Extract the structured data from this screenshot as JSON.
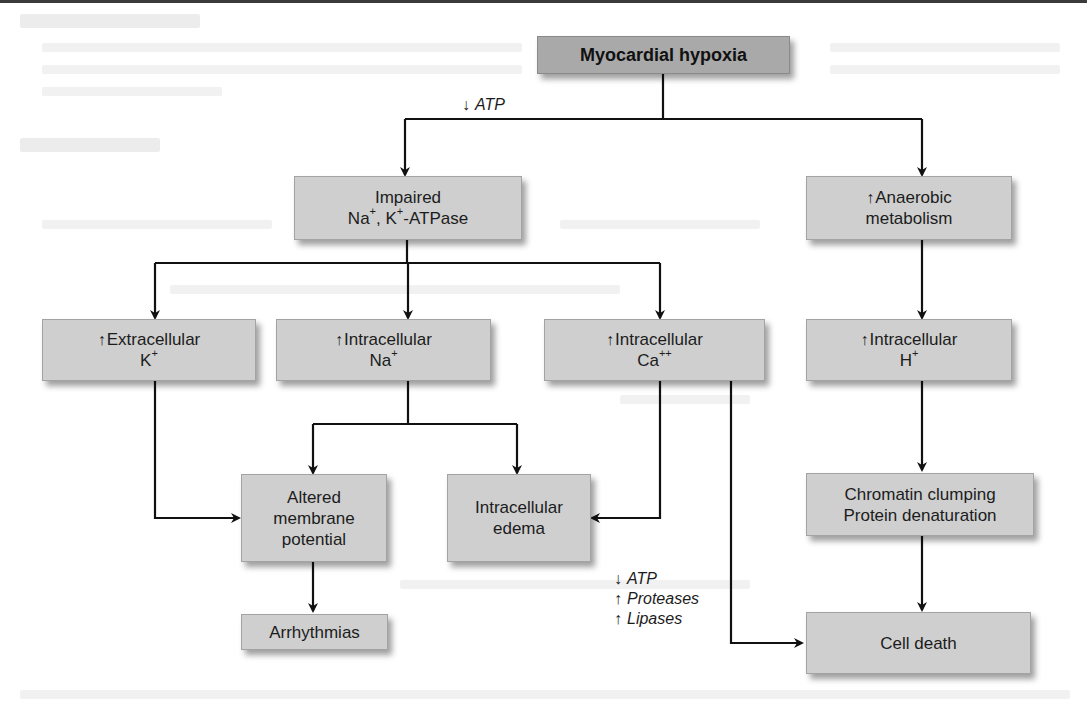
{
  "diagram": {
    "title": "Myocardial hypoxia",
    "root": {
      "label": "Myocardial hypoxia"
    },
    "edge_annotations": {
      "atp_decrease": {
        "arrow": "↓",
        "text": "ATP"
      },
      "cell_death_factors": [
        {
          "arrow": "↓",
          "text": "ATP"
        },
        {
          "arrow": "↑",
          "text": "Proteases"
        },
        {
          "arrow": "↑",
          "text": "Lipases"
        }
      ]
    },
    "nodes": {
      "impaired_pump": {
        "line1": "Impaired",
        "line2_a": "Na",
        "line2_a_sup": "+",
        "line2_b": ", K",
        "line2_b_sup": "+",
        "line2_c": "-ATPase"
      },
      "anaerobic": {
        "arrow": "↑",
        "line1": "Anaerobic",
        "line2": "metabolism"
      },
      "extracellular_k": {
        "arrow": "↑",
        "line1": "Extracellular",
        "line2": "K",
        "line2_sup": "+"
      },
      "intracellular_na": {
        "arrow": "↑",
        "line1": "Intracellular",
        "line2": "Na",
        "line2_sup": "+"
      },
      "intracellular_ca": {
        "arrow": "↑",
        "line1": "Intracellular",
        "line2": "Ca",
        "line2_sup": "++"
      },
      "intracellular_h": {
        "arrow": "↑",
        "line1": "Intracellular",
        "line2": "H",
        "line2_sup": "+"
      },
      "altered_membrane": {
        "line1": "Altered",
        "line2": "membrane",
        "line3": "potential"
      },
      "intracellular_edema": {
        "line1": "Intracellular",
        "line2": "edema"
      },
      "chromatin": {
        "line1": "Chromatin clumping",
        "line2": "Protein denaturation"
      },
      "arrhythmias": {
        "line1": "Arrhythmias"
      },
      "cell_death": {
        "line1": "Cell death"
      }
    },
    "edges": [
      {
        "from": "Myocardial hypoxia",
        "to": "Impaired Na+, K+-ATPase",
        "label": "↓ATP"
      },
      {
        "from": "Myocardial hypoxia",
        "to": "↑Anaerobic metabolism"
      },
      {
        "from": "Impaired Na+, K+-ATPase",
        "to": "↑Extracellular K+"
      },
      {
        "from": "Impaired Na+, K+-ATPase",
        "to": "↑Intracellular Na+"
      },
      {
        "from": "Impaired Na+, K+-ATPase",
        "to": "↑Intracellular Ca++"
      },
      {
        "from": "↑Anaerobic metabolism",
        "to": "↑Intracellular H+"
      },
      {
        "from": "↑Extracellular K+",
        "to": "Altered membrane potential"
      },
      {
        "from": "↑Intracellular Na+",
        "to": "Altered membrane potential"
      },
      {
        "from": "↑Intracellular Na+",
        "to": "Intracellular edema"
      },
      {
        "from": "↑Intracellular Ca++",
        "to": "Intracellular edema"
      },
      {
        "from": "↑Intracellular Ca++",
        "to": "Cell death",
        "label": "↓ATP ↑Proteases ↑Lipases"
      },
      {
        "from": "↑Intracellular H+",
        "to": "Chromatin clumping Protein denaturation"
      },
      {
        "from": "Chromatin clumping Protein denaturation",
        "to": "Cell death"
      },
      {
        "from": "Altered membrane potential",
        "to": "Arrhythmias"
      }
    ],
    "colors": {
      "root_fill": "#a9a9a9",
      "node_fill": "#cfcfcf",
      "connector": "#111111"
    }
  }
}
